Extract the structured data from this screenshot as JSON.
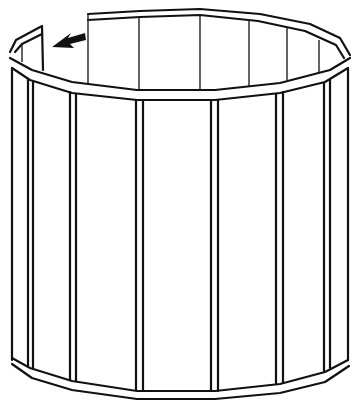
{
  "figure": {
    "annotation": "arrow pointing left at open end of top rail",
    "colors": {
      "line": "#111111",
      "background": "#ffffff"
    }
  }
}
